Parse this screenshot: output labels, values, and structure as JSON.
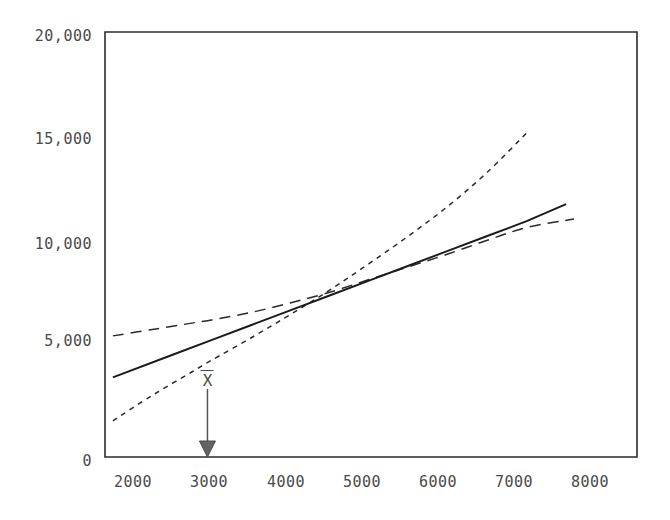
{
  "chart_data": {
    "type": "line",
    "title": "",
    "subtitle": "",
    "xlabel": "",
    "ylabel": "",
    "xlim": [
      1650,
      8400
    ],
    "ylim": [
      0,
      20000
    ],
    "grid": false,
    "legend_position": "none",
    "x_ticks": [
      2000,
      3000,
      4000,
      5000,
      6000,
      7000,
      8000
    ],
    "x_tick_labels": [
      "2000",
      "3000",
      "4000",
      "5000",
      "6000",
      "7000",
      "8000"
    ],
    "y_ticks": [
      0,
      5000,
      10000,
      15000,
      20000
    ],
    "y_tick_labels": [
      "0",
      "5,000",
      "10,000",
      "15,000",
      "20,000"
    ],
    "series": [
      {
        "name": "regression-line",
        "style": "solid",
        "color": "#1a1a1a",
        "x": [
          1750,
          2500,
          3000,
          3500,
          4000,
          4500,
          5000,
          5500,
          6000,
          6500,
          7000,
          7500
        ],
        "values": [
          3750,
          4800,
          5500,
          6200,
          6900,
          7600,
          8300,
          9000,
          9700,
          10400,
          11100,
          11900
        ]
      },
      {
        "name": "upper-confidence-band",
        "style": "short-dashed",
        "color": "#2a2a2a",
        "x": [
          1750,
          2250,
          2750,
          3000,
          3500,
          4000,
          4500,
          5000,
          5500,
          6000,
          6500,
          7000
        ],
        "values": [
          1700,
          2900,
          4000,
          4550,
          5600,
          6700,
          7850,
          9100,
          10400,
          11800,
          13400,
          15250
        ]
      },
      {
        "name": "lower-confidence-band",
        "style": "long-dashed",
        "color": "#2a2a2a",
        "x": [
          1750,
          2250,
          2750,
          3000,
          3500,
          4000,
          4500,
          5000,
          5500,
          6000,
          6500,
          7000,
          7600
        ],
        "values": [
          5700,
          6000,
          6300,
          6450,
          6800,
          7250,
          7750,
          8350,
          8950,
          9550,
          10200,
          10800,
          11200
        ]
      }
    ],
    "annotations": [
      {
        "name": "mean-marker",
        "label": "X",
        "overbar": true,
        "x": 2950,
        "arrow": "down",
        "arrow_from_y": 3200,
        "arrow_to_y": 0
      }
    ]
  },
  "axes": {
    "frame_color": "#2b2b2b",
    "tick_text_color": "#4a4a4a"
  }
}
